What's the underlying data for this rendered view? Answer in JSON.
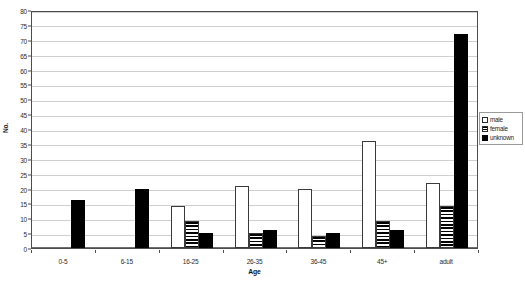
{
  "chart_data": {
    "type": "bar",
    "title": "",
    "xlabel": "Age",
    "ylabel": "No.",
    "categories": [
      "0-5",
      "6-15",
      "16-25",
      "26-35",
      "36-45",
      "45+",
      "adult"
    ],
    "series": [
      {
        "name": "male",
        "pattern": "white",
        "values": [
          0,
          0,
          14,
          21,
          20,
          36,
          22
        ]
      },
      {
        "name": "female",
        "pattern": "striped",
        "values": [
          0,
          0,
          9,
          5,
          4,
          9,
          14
        ]
      },
      {
        "name": "unknown",
        "pattern": "black",
        "values": [
          16,
          20,
          5,
          6,
          5,
          6,
          72
        ]
      }
    ],
    "ylim": [
      0,
      80
    ],
    "ytick_step": 5,
    "yticks": [
      "0",
      "5",
      "10",
      "15",
      "20",
      "25",
      "30",
      "35",
      "40",
      "45",
      "50",
      "55",
      "60",
      "65",
      "70",
      "75",
      "80"
    ],
    "grid": true,
    "legend_position": "right"
  },
  "legend": {
    "items": [
      {
        "label": "male",
        "swatch": "white-square-icon"
      },
      {
        "label": "female",
        "swatch": "striped-square-icon"
      },
      {
        "label": "unknown",
        "swatch": "black-square-icon"
      }
    ]
  }
}
